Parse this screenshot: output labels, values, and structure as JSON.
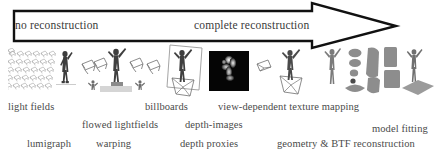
{
  "figure": {
    "background_color": "#ffffff",
    "ink_color": "#2a2a2a"
  },
  "arrow": {
    "name": "continuum-arrow",
    "direction": "left-to-right",
    "stroke_color": "#111111",
    "fill_color": "#ffffff",
    "left_label": "no reconstruction",
    "right_label": "complete reconstruction"
  },
  "captions": {
    "row1": [
      {
        "text": "light fields",
        "x": 8,
        "y": 101
      },
      {
        "text": "billboards",
        "x": 145,
        "y": 101
      },
      {
        "text": "view-dependent texture mapping",
        "x": 218,
        "y": 101
      }
    ],
    "row2": [
      {
        "text": "flowed lightfields",
        "x": 82,
        "y": 119
      },
      {
        "text": "depth-images",
        "x": 185,
        "y": 119
      },
      {
        "text": "model fitting",
        "x": 372,
        "y": 123
      }
    ],
    "row3": [
      {
        "text": "lumigraph",
        "x": 27,
        "y": 138
      },
      {
        "text": "warping",
        "x": 96,
        "y": 138
      },
      {
        "text": "depth proxies",
        "x": 180,
        "y": 138
      },
      {
        "text": "geometry & BTF reconstruction",
        "x": 277,
        "y": 138
      }
    ]
  },
  "clusters": [
    {
      "id": "light-fields-cluster",
      "label": "camera grid with actor",
      "icon": "camera-grid-icon"
    },
    {
      "id": "flowed-lightfields-cluster",
      "label": "multiple camera frusta around actor on pedestal",
      "icon": "camera-frustum-icon"
    },
    {
      "id": "billboards-cluster",
      "label": "billboard plane with actor and camera frustum",
      "icon": "billboard-icon"
    },
    {
      "id": "depth-image-cluster",
      "label": "black depth image of actor",
      "icon": "depth-image-icon"
    },
    {
      "id": "vdtm-cluster",
      "label": "camera frustum and actor on pedestal",
      "icon": "camera-frustum-icon"
    },
    {
      "id": "model-fitting-cluster",
      "label": "stick figure, BTF texture patches and fitted model on ground plane",
      "icon": "texture-patch-icon"
    }
  ]
}
